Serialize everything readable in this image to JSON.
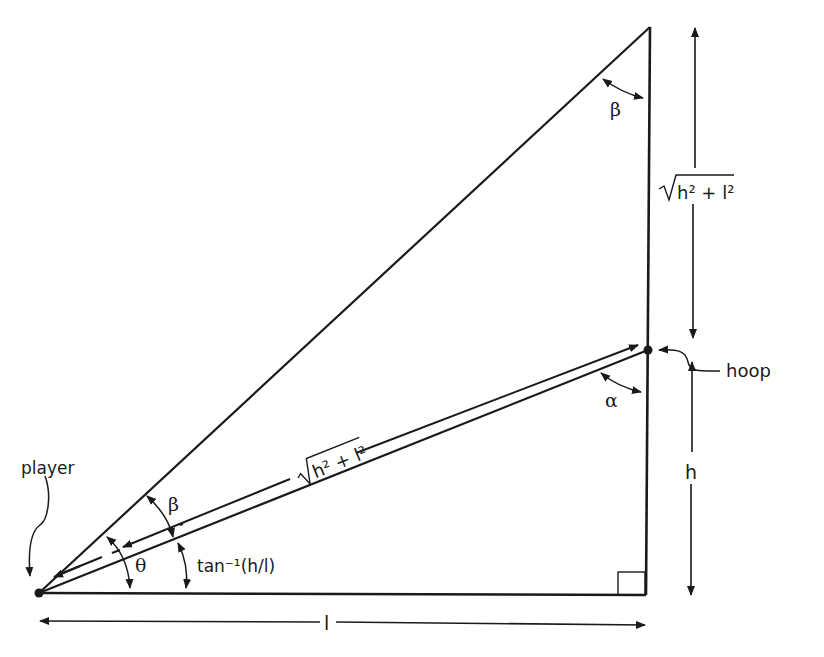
{
  "diagram": {
    "labels": {
      "player": "player",
      "hoop": "hoop",
      "beta_top": "β",
      "beta_bottom": "β",
      "alpha": "α",
      "theta": "θ",
      "arctan": "tan⁻¹(h/l)",
      "h": "h",
      "l": "l",
      "hyp_side": "h² + l²",
      "hyp_diag": "h² + l²"
    },
    "colors": {
      "stroke": "#1a1a1a",
      "background": "#ffffff"
    }
  }
}
